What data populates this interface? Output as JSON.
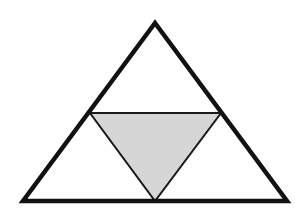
{
  "diagram": {
    "outer_triangle": {
      "vertices": [
        [
          155,
          23
        ],
        [
          23,
          201
        ],
        [
          287,
          201
        ]
      ],
      "stroke": "#111111",
      "stroke_width": 4.5,
      "fill": "#ffffff"
    },
    "inner_triangle": {
      "vertices": [
        [
          90,
          113
        ],
        [
          221,
          113
        ],
        [
          155,
          201
        ]
      ],
      "stroke": "#1a1a1a",
      "stroke_width": 2,
      "fill": "#d6d6d6",
      "shaded": true
    },
    "colors": {
      "background": "#ffffff",
      "line": "#111111",
      "shade": "#d6d6d6"
    }
  }
}
